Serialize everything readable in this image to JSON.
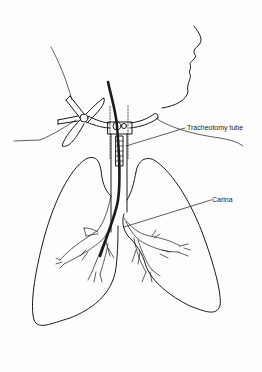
{
  "figure": {
    "labels": {
      "tracheotomy_tube": "Tracheotomy tube",
      "carina": "Carina"
    },
    "colors": {
      "line": "#1a1a1a",
      "background": "#fdfdfd"
    }
  }
}
